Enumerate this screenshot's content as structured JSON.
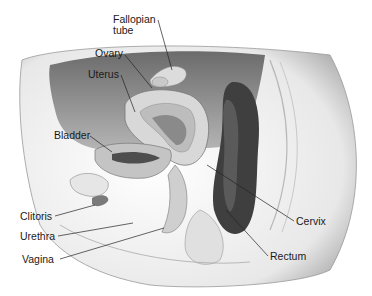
{
  "diagram": {
    "type": "anatomical-illustration",
    "labels": [
      {
        "id": "fallopian-tube",
        "text_line1": "Fallopian",
        "text_line2": "tube",
        "x": 113,
        "y": 14,
        "target": [
          172,
          70
        ]
      },
      {
        "id": "ovary",
        "text": "Ovary",
        "x": 95,
        "y": 48,
        "target": [
          152,
          88
        ]
      },
      {
        "id": "uterus",
        "text": "Uterus",
        "x": 88,
        "y": 69,
        "target": [
          135,
          112
        ]
      },
      {
        "id": "bladder",
        "text": "Bladder",
        "x": 54,
        "y": 130,
        "target": [
          112,
          152
        ]
      },
      {
        "id": "clitoris",
        "text": "Clitoris",
        "x": 20,
        "y": 211,
        "target": [
          95,
          205
        ]
      },
      {
        "id": "urethra",
        "text": "Urethra",
        "x": 20,
        "y": 231,
        "target": [
          133,
          223
        ]
      },
      {
        "id": "vagina",
        "text": "Vagina",
        "x": 22,
        "y": 254,
        "target": [
          164,
          228
        ]
      },
      {
        "id": "cervix",
        "text": "Cervix",
        "x": 296,
        "y": 216,
        "target": [
          207,
          165
        ]
      },
      {
        "id": "rectum",
        "text": "Rectum",
        "x": 270,
        "y": 251,
        "target": [
          226,
          210
        ]
      }
    ]
  }
}
